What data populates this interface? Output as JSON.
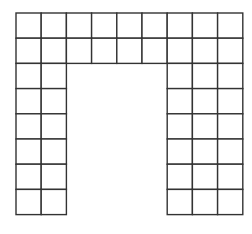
{
  "diagram": {
    "type": "grid-shape",
    "origin": {
      "x": 16,
      "y": 13
    },
    "cell_size": 25.2,
    "columns": 9,
    "rows": 8,
    "line_color": "#333333",
    "fill_color": "#ffffff",
    "filled_cells": [
      [
        1,
        1,
        1,
        1,
        1,
        1,
        1,
        1,
        1
      ],
      [
        1,
        1,
        1,
        1,
        1,
        1,
        1,
        1,
        1
      ],
      [
        1,
        1,
        0,
        0,
        0,
        0,
        1,
        1,
        1
      ],
      [
        1,
        1,
        0,
        0,
        0,
        0,
        1,
        1,
        1
      ],
      [
        1,
        1,
        0,
        0,
        0,
        0,
        1,
        1,
        1
      ],
      [
        1,
        1,
        0,
        0,
        0,
        0,
        1,
        1,
        1
      ],
      [
        1,
        1,
        0,
        0,
        0,
        0,
        1,
        1,
        1
      ],
      [
        1,
        1,
        0,
        0,
        0,
        0,
        1,
        1,
        1
      ]
    ],
    "total_squares": 48
  }
}
